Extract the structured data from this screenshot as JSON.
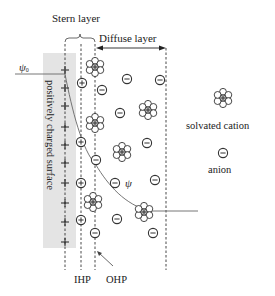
{
  "diagram": {
    "type": "electric-double-layer",
    "labels": {
      "stern_layer": "Stern layer",
      "diffuse_layer": "Diffuse layer",
      "surface": "positively charged surface",
      "psi0": "ψ",
      "psi0_sub": "0",
      "psi": "ψ",
      "ihp": "IHP",
      "ohp": "OHP"
    },
    "legend": {
      "cation_label": "solvated cation",
      "anion_label": "anion"
    },
    "colors": {
      "surface_fill": "#e4e4e4",
      "line": "#333333",
      "curve": "#666666",
      "text": "#222222"
    },
    "planes": {
      "surface_x": 65,
      "ihp_x": 81,
      "ohp_x": 95,
      "diffuse_end_x": 166
    },
    "surface_charges_y": [
      70,
      88,
      106,
      127,
      145,
      163,
      183,
      203,
      222,
      242
    ],
    "ihp_cations": [
      [
        82,
        83
      ],
      [
        81,
        142
      ],
      [
        81,
        183
      ],
      [
        81,
        220
      ]
    ],
    "solvated_cations": [
      [
        95,
        67
      ],
      [
        95,
        123
      ],
      [
        148,
        110
      ],
      [
        122,
        152
      ],
      [
        93,
        202
      ],
      [
        144,
        212
      ]
    ],
    "anions": [
      [
        127,
        79
      ],
      [
        160,
        80
      ],
      [
        102,
        90
      ],
      [
        120,
        113
      ],
      [
        147,
        143
      ],
      [
        96,
        160
      ],
      [
        115,
        183
      ],
      [
        155,
        180
      ],
      [
        117,
        219
      ],
      [
        153,
        233
      ],
      [
        95,
        233
      ]
    ]
  }
}
